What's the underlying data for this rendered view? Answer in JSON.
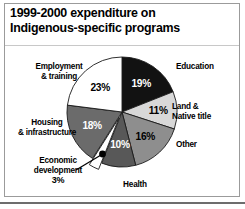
{
  "title": {
    "line1": "1999-2000 expenditure on",
    "line2": "Indigenous-specific programs"
  },
  "labels": {
    "employment": "Employment\n& training",
    "employment_l1": "Employment",
    "employment_l2": "& training",
    "housing_l1": "Housing",
    "housing_l2": "& infrastructure",
    "economic_l1": "Economic",
    "economic_l2": "development",
    "economic_pct": "3%",
    "health": "Health",
    "other": "Other",
    "land_l1": "Land &",
    "land_l2": "Native title",
    "education": "Education"
  },
  "chart_data": {
    "type": "pie",
    "title": "1999-2000 expenditure on Indigenous-specific programs",
    "xlabel": "",
    "ylabel": "",
    "units": "percent",
    "total": 100,
    "legend_position": "around-slices",
    "grid": false,
    "start_angle_deg": 0,
    "direction": "clockwise",
    "categories": [
      "Education",
      "Land & Native title",
      "Other",
      "Health",
      "Economic development",
      "Housing & infrastructure",
      "Employment & training"
    ],
    "values": [
      19,
      11,
      16,
      10,
      3,
      18,
      23
    ],
    "labels": [
      "19%",
      "11%",
      "16%",
      "10%",
      "3%",
      "18%",
      "23%"
    ],
    "colors": [
      "#121212",
      "#d8d8d8",
      "#8e8e8e",
      "#585858",
      "#ffffff",
      "#6b6b6b",
      "#ffffff"
    ],
    "exploded": [
      "Economic development"
    ],
    "slices": [
      {
        "name": "Education",
        "value": 19,
        "label": "19%",
        "color": "#121212",
        "label_color": "#ffffff"
      },
      {
        "name": "Land & Native title",
        "value": 11,
        "label": "11%",
        "color": "#d8d8d8",
        "label_color": "#000000"
      },
      {
        "name": "Other",
        "value": 16,
        "label": "16%",
        "color": "#8e8e8e",
        "label_color": "#000000"
      },
      {
        "name": "Health",
        "value": 10,
        "label": "10%",
        "color": "#585858",
        "label_color": "#ffffff"
      },
      {
        "name": "Economic development",
        "value": 3,
        "label": "3%",
        "color": "#ffffff",
        "label_color": "#000000"
      },
      {
        "name": "Housing & infrastructure",
        "value": 18,
        "label": "18%",
        "color": "#6b6b6b",
        "label_color": "#ffffff"
      },
      {
        "name": "Employment & training",
        "value": 23,
        "label": "23%",
        "color": "#ffffff",
        "label_color": "#000000"
      }
    ]
  }
}
